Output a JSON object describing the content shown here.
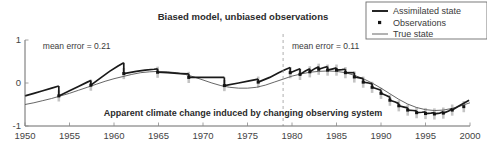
{
  "chart_data": {
    "type": "line",
    "title": "Biased model, unbiased observations",
    "caption": "Apparent climate change induced by changing observing system",
    "xlabel": "",
    "ylabel": "",
    "xlim": [
      1950,
      2000
    ],
    "ylim": [
      -1,
      1
    ],
    "grid": false,
    "xticks": [
      1950,
      1955,
      1960,
      1965,
      1970,
      1975,
      1980,
      1985,
      1990,
      1995,
      2000
    ],
    "xtick_labels": [
      "1950",
      "1955",
      "1960",
      "1965",
      "1970",
      "1975",
      "1980",
      "1985",
      "1990",
      "1995",
      "2000"
    ],
    "yticks": [
      1,
      0,
      -1
    ],
    "ytick_labels": [
      "1",
      "0",
      "-1"
    ],
    "legend_position": "top-right",
    "legend": [
      {
        "label": "Assimilated state",
        "marker": "thick-line",
        "color": "#1a1a1a"
      },
      {
        "label": "Observations",
        "marker": "dot",
        "color": "#141414"
      },
      {
        "label": "True state",
        "marker": "thin-line",
        "color": "#555555"
      }
    ],
    "annotations": [
      {
        "text": "mean error = 0.21",
        "x": 1952.0,
        "y": 0.8,
        "anchor": "start"
      },
      {
        "text": "mean error = 0.11",
        "x": 1980.0,
        "y": 0.8,
        "anchor": "start"
      }
    ],
    "vertical_divider": {
      "x": 1979.0,
      "style": "dashed",
      "color": "#9a9a9a"
    },
    "series": [
      {
        "name": "True state",
        "style": "thin-line",
        "color": "#555555",
        "x": [
          1950,
          1951,
          1952,
          1953,
          1954,
          1955,
          1956,
          1957,
          1958,
          1959,
          1960,
          1961,
          1962,
          1963,
          1964,
          1965,
          1966,
          1967,
          1968,
          1969,
          1970,
          1971,
          1972,
          1973,
          1974,
          1975,
          1976,
          1977,
          1978,
          1979,
          1980,
          1981,
          1982,
          1983,
          1984,
          1985,
          1986,
          1987,
          1988,
          1989,
          1990,
          1991,
          1992,
          1993,
          1994,
          1995,
          1996,
          1997,
          1998,
          1999,
          2000
        ],
        "values": [
          -0.5,
          -0.46,
          -0.41,
          -0.36,
          -0.3,
          -0.24,
          -0.17,
          -0.1,
          -0.03,
          0.04,
          0.1,
          0.15,
          0.2,
          0.24,
          0.26,
          0.27,
          0.26,
          0.24,
          0.2,
          0.14,
          0.07,
          0.0,
          -0.06,
          -0.1,
          -0.12,
          -0.12,
          -0.1,
          -0.05,
          0.02,
          0.09,
          0.16,
          0.21,
          0.25,
          0.27,
          0.28,
          0.27,
          0.24,
          0.18,
          0.1,
          0.0,
          -0.12,
          -0.25,
          -0.38,
          -0.49,
          -0.57,
          -0.62,
          -0.64,
          -0.63,
          -0.59,
          -0.53,
          -0.46
        ]
      },
      {
        "name": "Assimilated state",
        "style": "thick-line-sawtooth",
        "color": "#1a1a1a",
        "comment": "Sparse-observation era (pre-1979): model drifts upward from each analysis then is reset downward at each observation. Post-1979: annual observations keep it close to truth.",
        "segments": [
          {
            "x": [
              1950.0,
              1951.0,
              1952.0,
              1953.0,
              1953.8
            ],
            "values": [
              -0.3,
              -0.24,
              -0.18,
              -0.12,
              -0.07
            ]
          },
          {
            "x": [
              1953.8,
              1953.8
            ],
            "values": [
              -0.07,
              -0.3
            ]
          },
          {
            "x": [
              1953.8,
              1955.0,
              1956.0,
              1957.0,
              1957.4
            ],
            "values": [
              -0.3,
              -0.18,
              -0.08,
              0.02,
              0.06
            ]
          },
          {
            "x": [
              1957.4,
              1957.4
            ],
            "values": [
              0.06,
              -0.05
            ]
          },
          {
            "x": [
              1957.4,
              1958.5,
              1959.5,
              1960.5,
              1961.1
            ],
            "values": [
              -0.05,
              0.12,
              0.27,
              0.4,
              0.47
            ]
          },
          {
            "x": [
              1961.1,
              1961.1
            ],
            "values": [
              0.47,
              0.22
            ]
          },
          {
            "x": [
              1961.1,
              1962.5,
              1963.5,
              1964.5,
              1964.9
            ],
            "values": [
              0.22,
              0.27,
              0.3,
              0.32,
              0.33
            ]
          },
          {
            "x": [
              1964.9,
              1964.9
            ],
            "values": [
              0.33,
              0.25
            ]
          },
          {
            "x": [
              1964.9,
              1966.0,
              1967.5,
              1968.4
            ],
            "values": [
              0.25,
              0.24,
              0.22,
              0.21
            ]
          },
          {
            "x": [
              1968.4,
              1968.4
            ],
            "values": [
              0.21,
              0.13
            ]
          },
          {
            "x": [
              1968.4,
              1970.0,
              1971.5,
              1972.4
            ],
            "values": [
              0.13,
              0.13,
              0.13,
              0.13
            ]
          },
          {
            "x": [
              1972.4,
              1972.4
            ],
            "values": [
              0.13,
              -0.06
            ]
          },
          {
            "x": [
              1972.4,
              1974.0,
              1975.2,
              1976.2
            ],
            "values": [
              -0.06,
              0.0,
              0.05,
              0.09
            ]
          },
          {
            "x": [
              1976.2,
              1976.2
            ],
            "values": [
              0.09,
              0.02
            ]
          },
          {
            "x": [
              1976.2,
              1977.5,
              1978.5,
              1979.2,
              1979.8
            ],
            "values": [
              0.02,
              0.13,
              0.24,
              0.31,
              0.36
            ]
          },
          {
            "x": [
              1979.8,
              1979.8
            ],
            "values": [
              0.36,
              0.24
            ]
          },
          {
            "x": [
              1979.8,
              1980.4,
              1980.9
            ],
            "values": [
              0.24,
              0.29,
              0.33
            ]
          },
          {
            "x": [
              1980.9,
              1980.9
            ],
            "values": [
              0.33,
              0.2
            ]
          },
          {
            "x": [
              1980.9,
              1981.5,
              1982.0
            ],
            "values": [
              0.2,
              0.28,
              0.33
            ]
          },
          {
            "x": [
              1982.0,
              1982.0
            ],
            "values": [
              0.33,
              0.26
            ]
          },
          {
            "x": [
              1982.0,
              1982.6,
              1983.0
            ],
            "values": [
              0.26,
              0.34,
              0.38
            ]
          },
          {
            "x": [
              1983.0,
              1983.0
            ],
            "values": [
              0.38,
              0.32
            ]
          },
          {
            "x": [
              1983.0,
              1983.6,
              1984.0
            ],
            "values": [
              0.32,
              0.36,
              0.38
            ]
          },
          {
            "x": [
              1984.0,
              1984.0
            ],
            "values": [
              0.38,
              0.3
            ]
          },
          {
            "x": [
              1984.0,
              1984.6,
              1985.0
            ],
            "values": [
              0.3,
              0.33,
              0.35
            ]
          },
          {
            "x": [
              1985.0,
              1985.0
            ],
            "values": [
              0.35,
              0.3
            ]
          },
          {
            "x": [
              1985.0,
              1985.6,
              1986.0
            ],
            "values": [
              0.3,
              0.31,
              0.32
            ]
          },
          {
            "x": [
              1986.0,
              1986.0
            ],
            "values": [
              0.32,
              0.24
            ]
          },
          {
            "x": [
              1986.0,
              1986.6,
              1987.0
            ],
            "values": [
              0.24,
              0.24,
              0.24
            ]
          },
          {
            "x": [
              1987.0,
              1987.0
            ],
            "values": [
              0.24,
              0.14
            ]
          },
          {
            "x": [
              1987.0,
              1987.6,
              1988.0
            ],
            "values": [
              0.14,
              0.12,
              0.1
            ]
          },
          {
            "x": [
              1988.0,
              1988.0
            ],
            "values": [
              0.1,
              0.02
            ]
          },
          {
            "x": [
              1988.0,
              1988.6,
              1989.0
            ],
            "values": [
              0.02,
              0.0,
              -0.02
            ]
          },
          {
            "x": [
              1989.0,
              1989.0
            ],
            "values": [
              -0.02,
              -0.1
            ]
          },
          {
            "x": [
              1989.0,
              1989.6,
              1990.0
            ],
            "values": [
              -0.1,
              -0.14,
              -0.17
            ]
          },
          {
            "x": [
              1990.0,
              1990.0
            ],
            "values": [
              -0.17,
              -0.24
            ]
          },
          {
            "x": [
              1990.0,
              1990.6,
              1991.0
            ],
            "values": [
              -0.24,
              -0.29,
              -0.33
            ]
          },
          {
            "x": [
              1991.0,
              1991.0
            ],
            "values": [
              -0.33,
              -0.4
            ]
          },
          {
            "x": [
              1991.0,
              1991.6,
              1992.0
            ],
            "values": [
              -0.4,
              -0.44,
              -0.48
            ]
          },
          {
            "x": [
              1992.0,
              1992.0
            ],
            "values": [
              -0.48,
              -0.53
            ]
          },
          {
            "x": [
              1992.0,
              1992.6,
              1993.0
            ],
            "values": [
              -0.53,
              -0.56,
              -0.58
            ]
          },
          {
            "x": [
              1993.0,
              1993.0
            ],
            "values": [
              -0.58,
              -0.63
            ]
          },
          {
            "x": [
              1993.0,
              1993.6,
              1994.0
            ],
            "values": [
              -0.63,
              -0.64,
              -0.65
            ]
          },
          {
            "x": [
              1994.0,
              1994.0
            ],
            "values": [
              -0.65,
              -0.69
            ]
          },
          {
            "x": [
              1994.0,
              1994.6,
              1995.0
            ],
            "values": [
              -0.69,
              -0.68,
              -0.67
            ]
          },
          {
            "x": [
              1995.0,
              1995.0
            ],
            "values": [
              -0.67,
              -0.71
            ]
          },
          {
            "x": [
              1995.0,
              1995.6,
              1996.0
            ],
            "values": [
              -0.71,
              -0.7,
              -0.69
            ]
          },
          {
            "x": [
              1996.0,
              1996.0
            ],
            "values": [
              -0.69,
              -0.72
            ]
          },
          {
            "x": [
              1996.0,
              1996.6,
              1997.0
            ],
            "values": [
              -0.72,
              -0.7,
              -0.67
            ]
          },
          {
            "x": [
              1997.0,
              1997.0
            ],
            "values": [
              -0.67,
              -0.7
            ]
          },
          {
            "x": [
              1997.0,
              1997.6,
              1998.0
            ],
            "values": [
              -0.7,
              -0.65,
              -0.6
            ]
          },
          {
            "x": [
              1998.0,
              1998.0
            ],
            "values": [
              -0.6,
              -0.63
            ]
          },
          {
            "x": [
              1998.0,
              1998.7,
              1999.3,
              1999.9
            ],
            "values": [
              -0.63,
              -0.54,
              -0.47,
              -0.4
            ]
          }
        ]
      },
      {
        "name": "Observations",
        "style": "dot-with-errorbar",
        "color": "#141414",
        "x": [
          1953.8,
          1957.4,
          1961.1,
          1964.9,
          1968.4,
          1972.4,
          1976.2,
          1979.8,
          1980.9,
          1982.0,
          1983.0,
          1984.0,
          1985.0,
          1986.0,
          1987.0,
          1988.0,
          1989.0,
          1990.0,
          1991.0,
          1992.0,
          1993.0,
          1994.0,
          1995.0,
          1996.0,
          1997.0,
          1998.0,
          1999.3
        ],
        "values": [
          -0.3,
          -0.05,
          0.22,
          0.25,
          0.13,
          -0.06,
          0.02,
          0.24,
          0.2,
          0.26,
          0.32,
          0.3,
          0.3,
          0.24,
          0.14,
          0.02,
          -0.1,
          -0.24,
          -0.4,
          -0.53,
          -0.63,
          -0.69,
          -0.71,
          -0.72,
          -0.7,
          -0.63,
          -0.55
        ],
        "error": [
          0.13,
          0.13,
          0.13,
          0.13,
          0.13,
          0.13,
          0.13,
          0.13,
          0.13,
          0.13,
          0.13,
          0.13,
          0.13,
          0.13,
          0.13,
          0.13,
          0.13,
          0.13,
          0.13,
          0.13,
          0.13,
          0.13,
          0.13,
          0.13,
          0.13,
          0.13,
          0.13
        ]
      }
    ]
  }
}
